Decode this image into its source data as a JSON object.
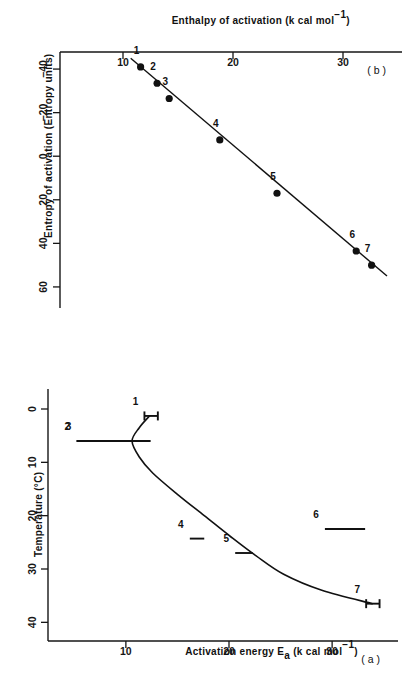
{
  "figure": {
    "rotation_degrees": 180,
    "background_color": "#ffffff",
    "ink_color": "#111111"
  },
  "panel_a": {
    "tag": "( a )",
    "xlabel": "Temperature (°C)",
    "ylabel_main": "Activation energy E",
    "ylabel_sub": "a",
    "ylabel_units": "(k cal  mol",
    "ylabel_units_sup": "−1",
    "ylabel_units_close": ")",
    "xticks": [
      "0",
      "10",
      "20",
      "30",
      "40"
    ],
    "yticks": [
      "10",
      "20",
      "30"
    ]
  },
  "panel_b": {
    "tag": "( b )",
    "xlabel": "Entropy of activation  (Entropy units)",
    "ylabel_main": "Enthalpy of activation (k cal  mol",
    "ylabel_sup": "−1",
    "ylabel_close": ")",
    "xticks": [
      "−40",
      "−20",
      "0",
      "20",
      "40",
      "60"
    ],
    "yticks": [
      "10",
      "20",
      "30"
    ]
  },
  "chart_data": [
    {
      "type": "line",
      "panel": "a",
      "title": "( a )",
      "xlabel": "Temperature (°C)",
      "ylabel": "Activation energy Ea (k cal mol−1)",
      "xlim": [
        -3,
        42
      ],
      "ylim": [
        4,
        36
      ],
      "xticks": [
        0,
        10,
        20,
        30,
        40
      ],
      "yticks": [
        10,
        20,
        30
      ],
      "grid": false,
      "legend": false,
      "errorbars": [
        {
          "label": "1",
          "x": 1.3,
          "y": 12.5,
          "ylow": 11.8,
          "yhigh": 13.1,
          "caps": true
        },
        {
          "label": "2",
          "x": 6.0,
          "y": 10.6,
          "ylow": 5.2,
          "yhigh": 11.3,
          "caps": false
        },
        {
          "label": "3",
          "x": 6.0,
          "y": 12.0,
          "ylow": 5.3,
          "yhigh": 12.4,
          "caps": false
        },
        {
          "label": "4",
          "x": 24.3,
          "y": 17.0,
          "ylow": 16.2,
          "yhigh": 17.6,
          "caps": false
        },
        {
          "label": "5",
          "x": 27.0,
          "y": 21.8,
          "ylow": 20.6,
          "yhigh": 22.3,
          "caps": false
        },
        {
          "label": "6",
          "x": 22.5,
          "y": 31.5,
          "ylow": 29.3,
          "yhigh": 33.2,
          "caps": false
        },
        {
          "label": "7",
          "x": 36.5,
          "y": 33.9,
          "ylow": 33.3,
          "yhigh": 34.6,
          "caps": true
        }
      ],
      "curve": [
        {
          "x": 1.3,
          "y": 12.3
        },
        {
          "x": 3.5,
          "y": 11.3
        },
        {
          "x": 6.0,
          "y": 10.6
        },
        {
          "x": 9.0,
          "y": 11.3
        },
        {
          "x": 12.0,
          "y": 12.6
        },
        {
          "x": 16.0,
          "y": 15.0
        },
        {
          "x": 20.0,
          "y": 17.6
        },
        {
          "x": 24.0,
          "y": 20.2
        },
        {
          "x": 27.5,
          "y": 22.6
        },
        {
          "x": 31.0,
          "y": 25.3
        },
        {
          "x": 34.0,
          "y": 29.0
        },
        {
          "x": 36.5,
          "y": 33.9
        }
      ]
    },
    {
      "type": "scatter",
      "panel": "b",
      "title": "( b )",
      "xlabel": "Entropy of activation (Entropy units)",
      "ylabel": "Enthalpy of activation (k cal mol−1)",
      "xlim": [
        -46,
        66
      ],
      "ylim": [
        5,
        35
      ],
      "xticks": [
        -40,
        -20,
        0,
        20,
        40,
        60
      ],
      "yticks": [
        10,
        20,
        30
      ],
      "grid": false,
      "legend": false,
      "points": [
        {
          "label": "1",
          "x": -41.0,
          "y": 11.6
        },
        {
          "label": "2",
          "x": -33.5,
          "y": 13.1
        },
        {
          "label": "3",
          "x": -26.5,
          "y": 14.2
        },
        {
          "label": "4",
          "x": -7.5,
          "y": 18.8
        },
        {
          "label": "5",
          "x": 17.0,
          "y": 24.0
        },
        {
          "label": "6",
          "x": 43.5,
          "y": 31.2
        },
        {
          "label": "7",
          "x": 50.0,
          "y": 32.6
        }
      ],
      "fit_line": {
        "x1": -45.0,
        "y1": 10.7,
        "x2": 55.0,
        "y2": 34.0
      }
    }
  ]
}
